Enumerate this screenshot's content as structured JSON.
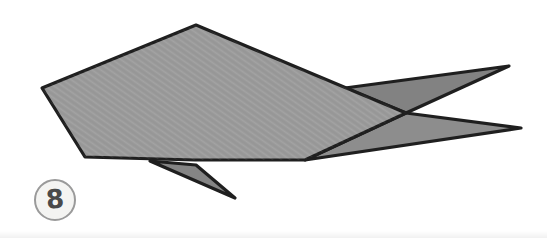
{
  "figure": {
    "step_label": "8"
  },
  "colors": {
    "background": "#ffffff",
    "outline": "#1f1f1f",
    "body_fill": "#9b9b9b",
    "tail_upper_fill": "#828282",
    "tail_lower_fill": "#8d8d8d",
    "fin_fill": "#858585",
    "badge_ring": "#9a9a9a",
    "badge_fill": "#f4f4f2",
    "badge_text": "#4a4a4a"
  },
  "shapes": [
    {
      "name": "fish-tail-upper-point",
      "points": "345,88 509,66 406,113",
      "fill": "tail_upper_fill"
    },
    {
      "name": "fish-tail-lower-point",
      "points": "406,113 521,128 305,160",
      "fill": "tail_lower_fill"
    },
    {
      "name": "fish-body",
      "points": "196,25 406,113 305,160 195,160 85,157 42,88",
      "fill": "body_fill"
    },
    {
      "name": "fish-bottom-fin",
      "points": "150,161 196,165 235,198",
      "fill": "fin_fill"
    }
  ]
}
